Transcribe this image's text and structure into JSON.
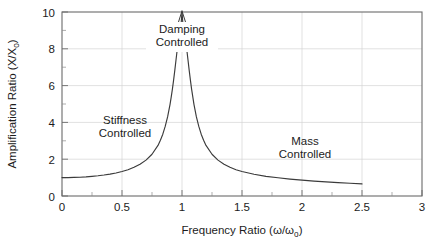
{
  "chart_data": {
    "type": "line",
    "title": "",
    "xlabel": "Frequency Ratio (ω/ωₒ)",
    "xlabel_main": "Frequency Ratio (",
    "xlabel_var1": "ω",
    "xlabel_slash": "/",
    "xlabel_var2": "ω",
    "xlabel_sub2": "o",
    "xlabel_close": ")",
    "ylabel": "Amplification Ratio (X/Xₒ)",
    "ylabel_main": "Amplification Ratio (X/X",
    "ylabel_sub": "o",
    "ylabel_close": ")",
    "xlim": [
      0,
      3
    ],
    "ylim": [
      0,
      10
    ],
    "x_ticks": [
      0,
      0.5,
      1,
      1.5,
      2,
      2.5,
      3
    ],
    "x_tick_labels": [
      "0",
      "0.5",
      "1",
      "1.5",
      "2",
      "2.5",
      "3"
    ],
    "x_minor_step": 0.25,
    "y_ticks": [
      0,
      2,
      4,
      6,
      8,
      10
    ],
    "y_tick_labels": [
      "0",
      "2",
      "4",
      "6",
      "8",
      "10"
    ],
    "y_minor_step": 0.5,
    "grid": true,
    "grid_color": "#d4d4d4",
    "legend": "none",
    "curve_color": "#3b3b3b",
    "damping_ratio": 0.05,
    "clipped_at_top": true,
    "x": [
      0,
      0.05,
      0.1,
      0.15,
      0.2,
      0.25,
      0.3,
      0.35,
      0.4,
      0.45,
      0.5,
      0.55,
      0.6,
      0.65,
      0.7,
      0.75,
      0.8,
      0.82,
      0.84,
      0.86,
      0.88,
      0.9,
      0.91,
      0.92,
      0.93,
      0.94,
      0.95,
      0.96,
      0.97,
      0.98,
      0.99,
      1.0,
      1.01,
      1.02,
      1.03,
      1.04,
      1.05,
      1.06,
      1.07,
      1.08,
      1.1,
      1.12,
      1.14,
      1.16,
      1.18,
      1.2,
      1.25,
      1.3,
      1.35,
      1.4,
      1.45,
      1.5,
      1.6,
      1.7,
      1.8,
      1.9,
      2.0,
      2.1,
      2.2,
      2.3,
      2.4,
      2.5
    ],
    "y": [
      1.0,
      1.0,
      1.01,
      1.02,
      1.04,
      1.07,
      1.1,
      1.14,
      1.19,
      1.25,
      1.33,
      1.43,
      1.56,
      1.73,
      1.95,
      2.27,
      2.75,
      3.03,
      3.36,
      3.78,
      4.3,
      4.97,
      5.37,
      5.81,
      6.3,
      6.83,
      7.39,
      7.95,
      8.46,
      8.87,
      9.13,
      10.0,
      9.13,
      8.87,
      8.46,
      7.95,
      7.39,
      6.83,
      6.3,
      5.81,
      4.97,
      4.3,
      3.78,
      3.36,
      3.03,
      2.75,
      2.27,
      1.95,
      1.73,
      1.56,
      1.43,
      1.33,
      1.18,
      1.07,
      0.99,
      0.92,
      0.86,
      0.81,
      0.77,
      0.73,
      0.69,
      0.66
    ],
    "annotations": [
      {
        "id": "stiffness",
        "text_line1": "Stiffness",
        "text_line2": "Controlled",
        "x": 0.52,
        "y": 3.6
      },
      {
        "id": "damping",
        "text_line1": "Damping",
        "text_line2": "Controlled",
        "x": 1.0,
        "y": 9.1,
        "has_arrow": true
      },
      {
        "id": "mass",
        "text_line1": "Mass",
        "text_line2": "Controlled",
        "x": 2.02,
        "y": 3.2
      }
    ]
  }
}
